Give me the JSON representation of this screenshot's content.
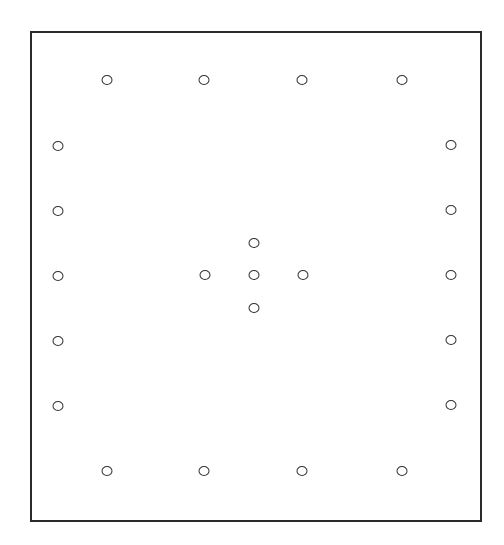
{
  "diagram": {
    "type": "point-layout",
    "frame": {
      "left": 30,
      "top": 31,
      "right": 481,
      "bottom": 521,
      "stroke": "#2a2a2a"
    },
    "marker": {
      "shape": "hollow-circle",
      "stroke": "#333333",
      "fill": "#ffffff"
    },
    "groups": [
      {
        "name": "top-row",
        "points": [
          [
            107,
            80
          ],
          [
            204,
            80
          ],
          [
            302,
            80
          ],
          [
            402,
            80
          ]
        ]
      },
      {
        "name": "left-column",
        "points": [
          [
            58,
            146
          ],
          [
            58,
            211
          ],
          [
            58,
            276
          ],
          [
            58,
            341
          ],
          [
            58,
            406
          ]
        ]
      },
      {
        "name": "right-column",
        "points": [
          [
            451,
            145
          ],
          [
            451,
            210
          ],
          [
            451,
            275
          ],
          [
            451,
            340
          ],
          [
            451,
            405
          ]
        ]
      },
      {
        "name": "bottom-row",
        "points": [
          [
            107,
            471
          ],
          [
            204,
            471
          ],
          [
            302,
            471
          ],
          [
            402,
            471
          ]
        ]
      },
      {
        "name": "center-cross",
        "points": [
          [
            254,
            243
          ],
          [
            205,
            275
          ],
          [
            254,
            275
          ],
          [
            303,
            275
          ],
          [
            254,
            308
          ]
        ]
      }
    ]
  }
}
